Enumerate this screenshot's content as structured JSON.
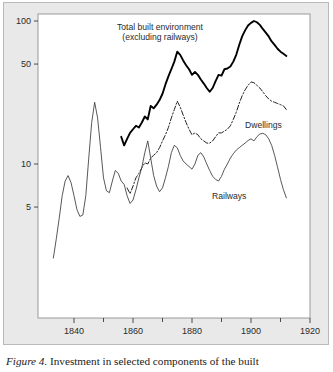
{
  "figure": {
    "caption_label": "Figure 4.",
    "caption_text": " Investment in selected components of the built",
    "background_color": "#e9e9e9",
    "plot_background_color": "#ffffff",
    "frame_color": "#9a9a9a"
  },
  "annotations": {
    "total_line1": "Total built environment",
    "total_line2": "(excluding railways)",
    "dwellings": "Dwellings",
    "railways": "Railways"
  },
  "axes": {
    "y_ticks": [
      "100",
      "50",
      "10",
      "5"
    ],
    "x_ticks": [
      "1840",
      "1860",
      "1880",
      "1900",
      "1920"
    ]
  },
  "chart_data": {
    "type": "line",
    "xlabel": "",
    "ylabel": "",
    "yscale": "log",
    "ylim": [
      2.0,
      130
    ],
    "xlim": [
      1831,
      1920
    ],
    "grid": false,
    "legend": "inline-annotations",
    "y_tick_values": [
      100,
      50,
      10,
      5
    ],
    "x_tick_values": [
      1840,
      1860,
      1880,
      1900,
      1920
    ],
    "x_minor_tick_values": [
      1850,
      1870,
      1890,
      1910
    ],
    "series": [
      {
        "name": "Total built environment (excluding railways)",
        "style": "solid-thick",
        "color": "#000000",
        "x": [
          1856,
          1857,
          1858,
          1859,
          1860,
          1861,
          1862,
          1863,
          1864,
          1865,
          1866,
          1867,
          1868,
          1869,
          1870,
          1871,
          1872,
          1873,
          1874,
          1875,
          1876,
          1877,
          1878,
          1879,
          1880,
          1881,
          1882,
          1883,
          1884,
          1885,
          1886,
          1887,
          1888,
          1889,
          1890,
          1891,
          1892,
          1893,
          1894,
          1895,
          1896,
          1897,
          1898,
          1899,
          1900,
          1901,
          1902,
          1903,
          1904,
          1905,
          1906,
          1907,
          1908,
          1909,
          1910,
          1911,
          1912
        ],
        "y": [
          15.5,
          13.5,
          15.0,
          16.5,
          17.5,
          18.5,
          18.0,
          19.5,
          21.5,
          20.5,
          25.5,
          24.5,
          26.0,
          28.0,
          31.0,
          36.0,
          41.0,
          46.0,
          52.0,
          61.0,
          58.0,
          53.0,
          49.0,
          46.0,
          42.0,
          44.0,
          42.0,
          39.0,
          36.5,
          34.0,
          32.0,
          34.0,
          38.0,
          42.0,
          41.5,
          46.0,
          46.5,
          48.0,
          52.0,
          58.0,
          68.0,
          78.0,
          86.0,
          93.0,
          97.0,
          100.0,
          98.0,
          94.0,
          88.0,
          83.0,
          78.0,
          72.0,
          68.0,
          64.0,
          61.0,
          59.0,
          57.0
        ]
      },
      {
        "name": "Dwellings",
        "style": "dash-dot",
        "color": "#222222",
        "x": [
          1858,
          1859,
          1860,
          1861,
          1862,
          1863,
          1864,
          1865,
          1866,
          1867,
          1868,
          1869,
          1870,
          1871,
          1872,
          1873,
          1874,
          1875,
          1876,
          1877,
          1878,
          1879,
          1880,
          1881,
          1882,
          1883,
          1884,
          1885,
          1886,
          1887,
          1888,
          1889,
          1890,
          1891,
          1892,
          1893,
          1894,
          1895,
          1896,
          1897,
          1898,
          1899,
          1900,
          1901,
          1902,
          1903,
          1904,
          1905,
          1906,
          1907,
          1908,
          1909,
          1910,
          1911,
          1912
        ],
        "y": [
          6.8,
          6.2,
          7.0,
          8.0,
          8.6,
          9.4,
          10.2,
          10.0,
          11.0,
          11.5,
          12.0,
          13.0,
          14.5,
          16.0,
          18.0,
          21.0,
          24.0,
          27.5,
          25.0,
          22.0,
          19.5,
          17.5,
          16.0,
          16.5,
          16.0,
          15.0,
          14.5,
          14.0,
          14.0,
          14.5,
          15.5,
          16.5,
          16.5,
          17.0,
          17.5,
          18.5,
          20.5,
          23.0,
          26.5,
          30.0,
          33.0,
          35.5,
          37.5,
          37.0,
          35.5,
          34.0,
          32.0,
          30.0,
          28.5,
          27.5,
          27.0,
          26.5,
          26.0,
          25.5,
          24.0
        ]
      },
      {
        "name": "Railways",
        "style": "solid-thin",
        "color": "#3a3a3a",
        "x": [
          1833,
          1834,
          1835,
          1836,
          1837,
          1838,
          1839,
          1840,
          1841,
          1842,
          1843,
          1844,
          1845,
          1846,
          1847,
          1848,
          1849,
          1850,
          1851,
          1852,
          1853,
          1854,
          1855,
          1856,
          1857,
          1858,
          1859,
          1860,
          1861,
          1862,
          1863,
          1864,
          1865,
          1866,
          1867,
          1868,
          1869,
          1870,
          1871,
          1872,
          1873,
          1874,
          1875,
          1876,
          1877,
          1878,
          1879,
          1880,
          1881,
          1882,
          1883,
          1884,
          1885,
          1886,
          1887,
          1888,
          1889,
          1890,
          1891,
          1892,
          1893,
          1894,
          1895,
          1896,
          1897,
          1898,
          1899,
          1900,
          1901,
          1902,
          1903,
          1904,
          1905,
          1906,
          1907,
          1908,
          1909,
          1910,
          1911,
          1912
        ],
        "y": [
          2.2,
          3.0,
          4.2,
          6.0,
          7.6,
          8.3,
          7.4,
          6.0,
          4.8,
          4.3,
          4.4,
          6.0,
          11.0,
          19.5,
          27.0,
          21.0,
          13.0,
          8.0,
          6.5,
          6.3,
          7.6,
          9.0,
          8.6,
          7.6,
          7.2,
          6.0,
          5.3,
          5.6,
          6.6,
          8.0,
          9.5,
          12.0,
          14.5,
          11.0,
          8.3,
          7.0,
          6.4,
          6.8,
          8.0,
          9.6,
          12.0,
          13.5,
          13.0,
          11.5,
          10.5,
          10.0,
          9.6,
          9.2,
          10.0,
          11.5,
          12.0,
          11.2,
          10.0,
          9.0,
          8.2,
          7.8,
          7.6,
          8.2,
          9.2,
          10.0,
          11.0,
          11.8,
          12.5,
          13.0,
          13.5,
          14.0,
          14.6,
          15.0,
          14.5,
          15.5,
          16.2,
          16.4,
          16.0,
          15.0,
          13.5,
          11.5,
          9.5,
          7.8,
          6.6,
          5.8
        ]
      }
    ]
  }
}
